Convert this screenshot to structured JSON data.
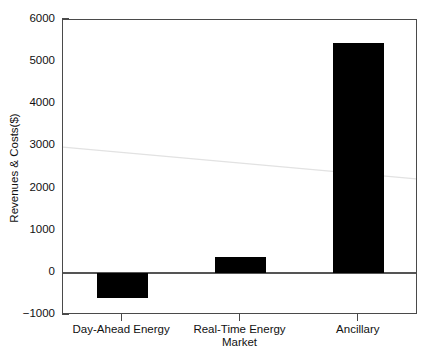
{
  "chart_data": {
    "type": "bar",
    "title": "",
    "subtitle": "",
    "categories": [
      "Day-Ahead Energy",
      "Real-Time Energy",
      "Ancillary"
    ],
    "values": [
      -600,
      380,
      5450
    ],
    "xlabel": "Market",
    "ylabel": "Revenues & Costs($)",
    "ylim": [
      -1000,
      6000
    ],
    "yticks": [
      -1000,
      0,
      1000,
      2000,
      3000,
      4000,
      5000,
      6000
    ],
    "ytick_labels": [
      "-1000",
      "0",
      "1000",
      "2000",
      "3000",
      "4000",
      "5000",
      "6000"
    ],
    "xtick_labels": [
      "Day-Ahead Energy",
      "Real-Time Energy",
      "Ancillary"
    ],
    "grid": false,
    "legend": null,
    "legend_position": "none",
    "bar_color": "#000000",
    "axis_color": "#4a4a4a",
    "background_color": "#ffffff",
    "annotations": []
  },
  "figure": {
    "frame_label": "plot-frame"
  }
}
